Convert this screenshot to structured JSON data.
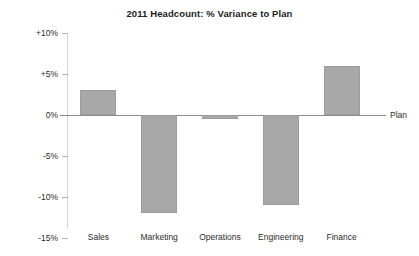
{
  "chart_data": {
    "type": "bar",
    "title": "2011 Headcount: % Variance to Plan",
    "xlabel": "",
    "ylabel": "",
    "categories": [
      "Sales",
      "Marketing",
      "Operations",
      "Engineering",
      "Finance"
    ],
    "values": [
      3,
      -12,
      -0.5,
      -11,
      6
    ],
    "series": [
      {
        "name": "% Variance to Plan",
        "values": [
          3,
          -12,
          -0.5,
          -11,
          6
        ]
      }
    ],
    "ylim": [
      -15,
      10
    ],
    "ytick_values": [
      10,
      5,
      0,
      -5,
      -10,
      -15
    ],
    "ytick_labels": [
      "+10%",
      "+5%",
      "0%",
      "-5%",
      "-10%",
      "-15%"
    ],
    "grid": false,
    "legend": false,
    "annotations": [
      {
        "name": "plan-baseline",
        "label": "Plan",
        "value": 0
      }
    ],
    "colors": {
      "bar_fill": "#a8a8a8",
      "bar_border": "#9d9d9d",
      "baseline": "#8c8c8c",
      "axis": "#d3d3d3",
      "text": "#2b2b2b",
      "title": "#1c1c1c",
      "background": "#ffffff"
    }
  }
}
